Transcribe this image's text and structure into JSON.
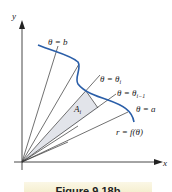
{
  "figure": {
    "axes": {
      "x_label": "x",
      "y_label": "y"
    },
    "labels": {
      "theta_b": "θ = b",
      "theta_i": "θ = θ",
      "theta_i_sub": "i",
      "theta_im1": "θ = θ",
      "theta_im1_sub": "i−1",
      "theta_a": "θ = a",
      "curve": "r = f(θ)",
      "area": "A",
      "area_sub": "i"
    },
    "caption": "Figure 9.18b",
    "colors": {
      "curve": "#2a5ea8",
      "shaded_sector": "#e2e4ea",
      "lines": "#333333"
    }
  }
}
